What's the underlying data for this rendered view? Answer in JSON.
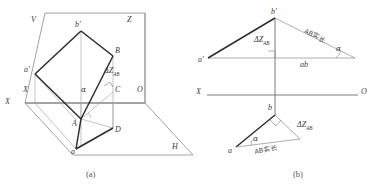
{
  "figure": {
    "colors": {
      "bold_line": "#2e2e2e",
      "thin_line": "#8a8a8a",
      "axis_line": "#6e6e6e",
      "text": "#3c3c3c",
      "background": "#ffffff"
    }
  },
  "panel_a": {
    "caption": "(a)",
    "plane_labels": {
      "vertical_plane": "V",
      "horizontal_plane": "H",
      "z_axis": "Z",
      "x_axis": "X",
      "origin": "O"
    },
    "points": {
      "b_prime": "b′",
      "a_prime": "a′",
      "B": "B",
      "A": "A",
      "C": "C",
      "D": "D",
      "a": "a",
      "b": "b"
    },
    "annotations": {
      "delta_z": "ΔZ",
      "delta_z_sub": "AB",
      "alpha": "α"
    }
  },
  "panel_b": {
    "caption": "(b)",
    "axis": {
      "left_label": "X",
      "right_label": "O"
    },
    "upper_triangle": {
      "apex": "b′",
      "left_vertex": "a′",
      "vertical_leg": "ΔZ",
      "vertical_leg_sub": "AB",
      "hypotenuse": "AB实长",
      "base": "ab",
      "angle": "α"
    },
    "lower_triangle": {
      "apex": "b",
      "left_vertex": "a",
      "vertical_leg": "ΔZ",
      "vertical_leg_sub": "AB",
      "hypotenuse": "AB实长",
      "angle": "α"
    }
  }
}
